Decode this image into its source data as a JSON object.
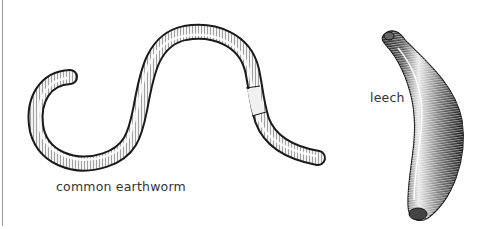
{
  "figure": {
    "specimens": [
      {
        "id": "earthworm",
        "label": "common earthworm"
      },
      {
        "id": "leech",
        "label": "leech"
      }
    ],
    "colors": {
      "ink": "#1a1a1a",
      "body_fill": "#f2f2f2",
      "label_text": "#333333",
      "border": "#9a9a9a"
    }
  }
}
